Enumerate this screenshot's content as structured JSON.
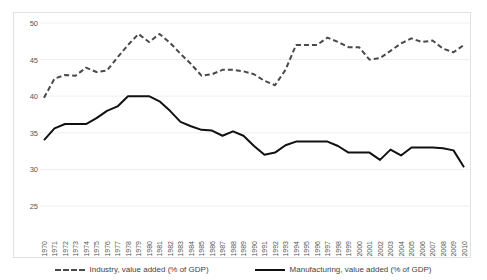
{
  "chart_data": {
    "type": "line",
    "title": "",
    "xlabel": "",
    "ylabel": "",
    "ylim": [
      25,
      50
    ],
    "yticks": [
      25,
      30,
      35,
      40,
      45,
      50
    ],
    "grid": true,
    "legend_position": "bottom",
    "x": [
      1970,
      1971,
      1972,
      1973,
      1974,
      1975,
      1976,
      1977,
      1978,
      1979,
      1980,
      1981,
      1982,
      1983,
      1984,
      1985,
      1986,
      1987,
      1988,
      1989,
      1990,
      1991,
      1992,
      1993,
      1994,
      1995,
      1996,
      1997,
      1998,
      1999,
      2000,
      2001,
      2002,
      2003,
      2004,
      2005,
      2006,
      2007,
      2008,
      2009,
      2010
    ],
    "series": [
      {
        "name": "Industry, value added (% of GDP)",
        "style": "dashed",
        "color": "#4a4a4a",
        "values": [
          39.8,
          42.4,
          42.9,
          42.8,
          43.9,
          43.3,
          43.5,
          45.3,
          47.0,
          48.5,
          47.4,
          48.5,
          47.3,
          45.8,
          44.4,
          42.8,
          43.0,
          43.6,
          43.6,
          43.4,
          43.0,
          42.1,
          41.5,
          43.6,
          47.0,
          47.0,
          47.0,
          48.0,
          47.4,
          46.7,
          46.7,
          45.0,
          45.2,
          46.2,
          47.2,
          47.9,
          47.4,
          47.6,
          46.5,
          46.0,
          47.0
        ]
      },
      {
        "name": "Manufacturing, value added (% of GDP)",
        "style": "solid",
        "color": "#111111",
        "values": [
          34.0,
          35.6,
          36.2,
          36.2,
          36.2,
          37.0,
          38.0,
          38.6,
          40.0,
          40.0,
          40.0,
          39.3,
          38.0,
          36.5,
          35.9,
          35.4,
          35.3,
          34.6,
          35.2,
          34.6,
          33.2,
          32.0,
          32.3,
          33.3,
          33.8,
          33.8,
          33.8,
          33.8,
          33.2,
          32.3,
          32.3,
          32.3,
          31.3,
          32.7,
          31.9,
          33.0,
          33.0,
          33.0,
          32.9,
          32.6,
          30.3
        ]
      }
    ]
  },
  "legend": {
    "items": [
      {
        "label": "Industry, value added (% of GDP)",
        "style": "dashed"
      },
      {
        "label": "Manufacturing, value added (% of GDP)",
        "style": "solid"
      }
    ]
  }
}
